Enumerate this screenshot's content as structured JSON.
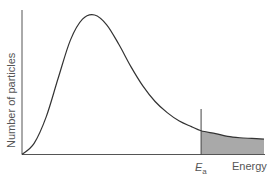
{
  "chart_data": {
    "type": "line",
    "title": "",
    "subtitle": "Maxwell–Boltzmann distribution with activation energy",
    "xlabel": "Energy",
    "ylabel": "Number of particles",
    "x_ticks": [],
    "y_ticks": [],
    "grid": false,
    "legend": null,
    "annotations": [
      {
        "type": "vline",
        "label": "E",
        "subscript": "a",
        "x_fraction": 0.74
      },
      {
        "type": "shaded_area",
        "description": "Area under curve to the right of Ea (particles with energy ≥ Ea)",
        "color": "#a9a9a9"
      }
    ],
    "series": [
      {
        "name": "Distribution of particle energies",
        "x": [
          0,
          0.05,
          0.1,
          0.15,
          0.2,
          0.25,
          0.3,
          0.35,
          0.4,
          0.45,
          0.5,
          0.55,
          0.6,
          0.65,
          0.7,
          0.74,
          0.8,
          0.85,
          0.9,
          0.95,
          1.0
        ],
        "values": [
          0,
          0.08,
          0.27,
          0.55,
          0.82,
          0.97,
          1.0,
          0.93,
          0.79,
          0.63,
          0.49,
          0.38,
          0.3,
          0.24,
          0.2,
          0.17,
          0.15,
          0.13,
          0.12,
          0.115,
          0.11
        ]
      }
    ],
    "xlim": [
      0,
      1
    ],
    "ylim": [
      0,
      1.05
    ]
  },
  "labels": {
    "y_axis": "Number of particles",
    "x_axis": "Energy",
    "ea_main": "E",
    "ea_sub": "a"
  }
}
